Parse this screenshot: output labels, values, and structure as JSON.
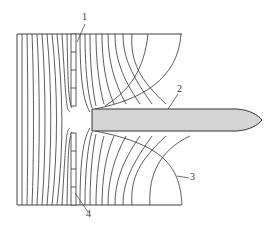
{
  "diagram": {
    "type": "field-lines",
    "frame": {
      "left": 17,
      "top": 34,
      "right": 182,
      "bottom": 205
    },
    "labels": [
      {
        "id": "1",
        "text": "1",
        "x": 82,
        "y": 12,
        "leader": [
          [
            85,
            24
          ],
          [
            77,
            42
          ]
        ]
      },
      {
        "id": "2",
        "text": "2",
        "x": 177,
        "y": 84,
        "leader": [
          [
            178,
            94
          ],
          [
            168,
            109
          ]
        ]
      },
      {
        "id": "3",
        "text": "3",
        "x": 190,
        "y": 174,
        "leader": [
          [
            189,
            178
          ],
          [
            177,
            176
          ]
        ]
      },
      {
        "id": "4",
        "text": "4",
        "x": 86,
        "y": 209,
        "leader": [
          [
            88,
            212
          ],
          [
            75,
            193
          ]
        ]
      }
    ],
    "electrode": {
      "fill": "#d4d4d4",
      "stroke": "#333333"
    },
    "line_color": "#333333"
  }
}
